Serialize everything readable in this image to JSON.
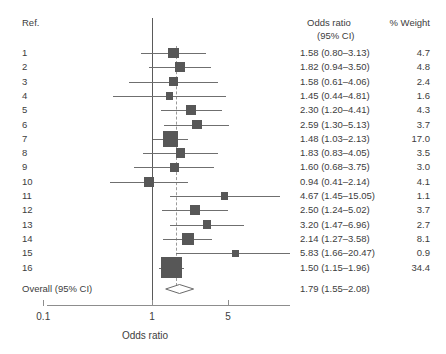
{
  "figure": {
    "ref_header": "Ref.",
    "or_header_line1": "Odds ratio",
    "or_header_line2": "(95% CI)",
    "weight_header": "% Weight",
    "axis_title": "Odds ratio",
    "overall_label": "Overall (95% CI)",
    "overall_or_text": "1.79 (1.55–2.08)"
  },
  "chart_data": {
    "type": "forest",
    "title": "",
    "xlabel": "Odds ratio",
    "ylabel": "Ref.",
    "xscale": "log",
    "xlim": [
      0.1,
      10
    ],
    "xticks": [
      0.1,
      1,
      5
    ],
    "xticklabels": [
      "0.1",
      "1",
      "5"
    ],
    "null_value": 1,
    "pooled_reference_line": 1.79,
    "grid": false,
    "columns": [
      "Ref.",
      "Odds ratio (95% CI)",
      "% Weight"
    ],
    "studies": [
      {
        "ref": "1",
        "or": 1.58,
        "lower": 0.8,
        "upper": 3.13,
        "weight": 4.7,
        "or_text": "1.58 (0.80–3.13)",
        "weight_text": "4.7"
      },
      {
        "ref": "2",
        "or": 1.82,
        "lower": 0.94,
        "upper": 3.5,
        "weight": 4.8,
        "or_text": "1.82 (0.94–3.50)",
        "weight_text": "4.8"
      },
      {
        "ref": "3",
        "or": 1.58,
        "lower": 0.61,
        "upper": 4.06,
        "weight": 2.4,
        "or_text": "1.58 (0.61–4.06)",
        "weight_text": "2.4"
      },
      {
        "ref": "4",
        "or": 1.45,
        "lower": 0.44,
        "upper": 4.81,
        "weight": 1.6,
        "or_text": "1.45 (0.44–4.81)",
        "weight_text": "1.6"
      },
      {
        "ref": "5",
        "or": 2.3,
        "lower": 1.2,
        "upper": 4.41,
        "weight": 4.3,
        "or_text": "2.30 (1.20–4.41)",
        "weight_text": "4.3"
      },
      {
        "ref": "6",
        "or": 2.59,
        "lower": 1.3,
        "upper": 5.13,
        "weight": 3.7,
        "or_text": "2.59 (1.30–5.13)",
        "weight_text": "3.7"
      },
      {
        "ref": "7",
        "or": 1.48,
        "lower": 1.03,
        "upper": 2.13,
        "weight": 17.0,
        "or_text": "1.48 (1.03–2.13)",
        "weight_text": "17.0"
      },
      {
        "ref": "8",
        "or": 1.83,
        "lower": 0.83,
        "upper": 4.05,
        "weight": 3.5,
        "or_text": "1.83 (0.83–4.05)",
        "weight_text": "3.5"
      },
      {
        "ref": "9",
        "or": 1.6,
        "lower": 0.68,
        "upper": 3.75,
        "weight": 3.0,
        "or_text": "1.60 (0.68–3.75)",
        "weight_text": "3.0"
      },
      {
        "ref": "10",
        "or": 0.94,
        "lower": 0.41,
        "upper": 2.14,
        "weight": 4.1,
        "or_text": "0.94 (0.41–2.14)",
        "weight_text": "4.1"
      },
      {
        "ref": "11",
        "or": 4.67,
        "lower": 1.45,
        "upper": 15.05,
        "weight": 1.1,
        "or_text": "4.67 (1.45–15.05)",
        "weight_text": "1.1"
      },
      {
        "ref": "12",
        "or": 2.5,
        "lower": 1.24,
        "upper": 5.02,
        "weight": 3.7,
        "or_text": "2.50 (1.24–5.02)",
        "weight_text": "3.7"
      },
      {
        "ref": "13",
        "or": 3.2,
        "lower": 1.47,
        "upper": 6.96,
        "weight": 2.7,
        "or_text": "3.20 (1.47–6.96)",
        "weight_text": "2.7"
      },
      {
        "ref": "14",
        "or": 2.14,
        "lower": 1.27,
        "upper": 3.58,
        "weight": 8.1,
        "or_text": "2.14 (1.27–3.58)",
        "weight_text": "8.1"
      },
      {
        "ref": "15",
        "or": 5.83,
        "lower": 1.66,
        "upper": 20.47,
        "weight": 0.9,
        "or_text": "5.83 (1.66–20.47)",
        "weight_text": "0.9"
      },
      {
        "ref": "16",
        "or": 1.5,
        "lower": 1.15,
        "upper": 1.96,
        "weight": 34.4,
        "or_text": "1.50 (1.15–1.96)",
        "weight_text": "34.4"
      }
    ],
    "overall": {
      "label": "Overall (95% CI)",
      "or": 1.79,
      "lower": 1.55,
      "upper": 2.08,
      "or_text": "1.79 (1.55–2.08)"
    }
  },
  "colors": {
    "marker": "#575757",
    "line": "#6f6f6f",
    "axis": "#8d8d8d",
    "null_line": "#5a5a5a",
    "pooled_dash": "#9a9a9a",
    "text": "#3d3d3d",
    "background": "#ffffff"
  }
}
